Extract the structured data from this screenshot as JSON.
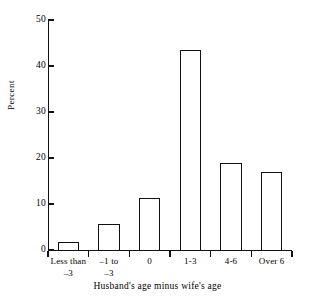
{
  "chart_data": {
    "type": "bar",
    "title": "",
    "xlabel": "Husband's age minus wife's age",
    "ylabel": "Percent",
    "categories": [
      "Less than\n–3",
      "–1 to\n–3",
      "0",
      "1-3",
      "4-6",
      "Over 6"
    ],
    "category_lines": [
      [
        "Less than",
        "–3"
      ],
      [
        "–1 to",
        "–3"
      ],
      [
        "0",
        ""
      ],
      [
        "1-3",
        ""
      ],
      [
        "4-6",
        ""
      ],
      [
        "Over 6",
        ""
      ]
    ],
    "values": [
      1.7,
      5.7,
      11.3,
      43.5,
      19.0,
      17.0
    ],
    "ylim": [
      0,
      50
    ],
    "yticks": [
      0,
      10,
      20,
      30,
      40,
      50
    ],
    "ytick_labels": [
      "0",
      "10",
      "20",
      "30",
      "40",
      "50"
    ],
    "grid": false,
    "legend": false,
    "bar_style": {
      "fill": "none",
      "edge_color": "#111111",
      "edge_width": 1.3
    }
  },
  "figure": {
    "background": "#ffffff",
    "axis_color": "#111111"
  }
}
